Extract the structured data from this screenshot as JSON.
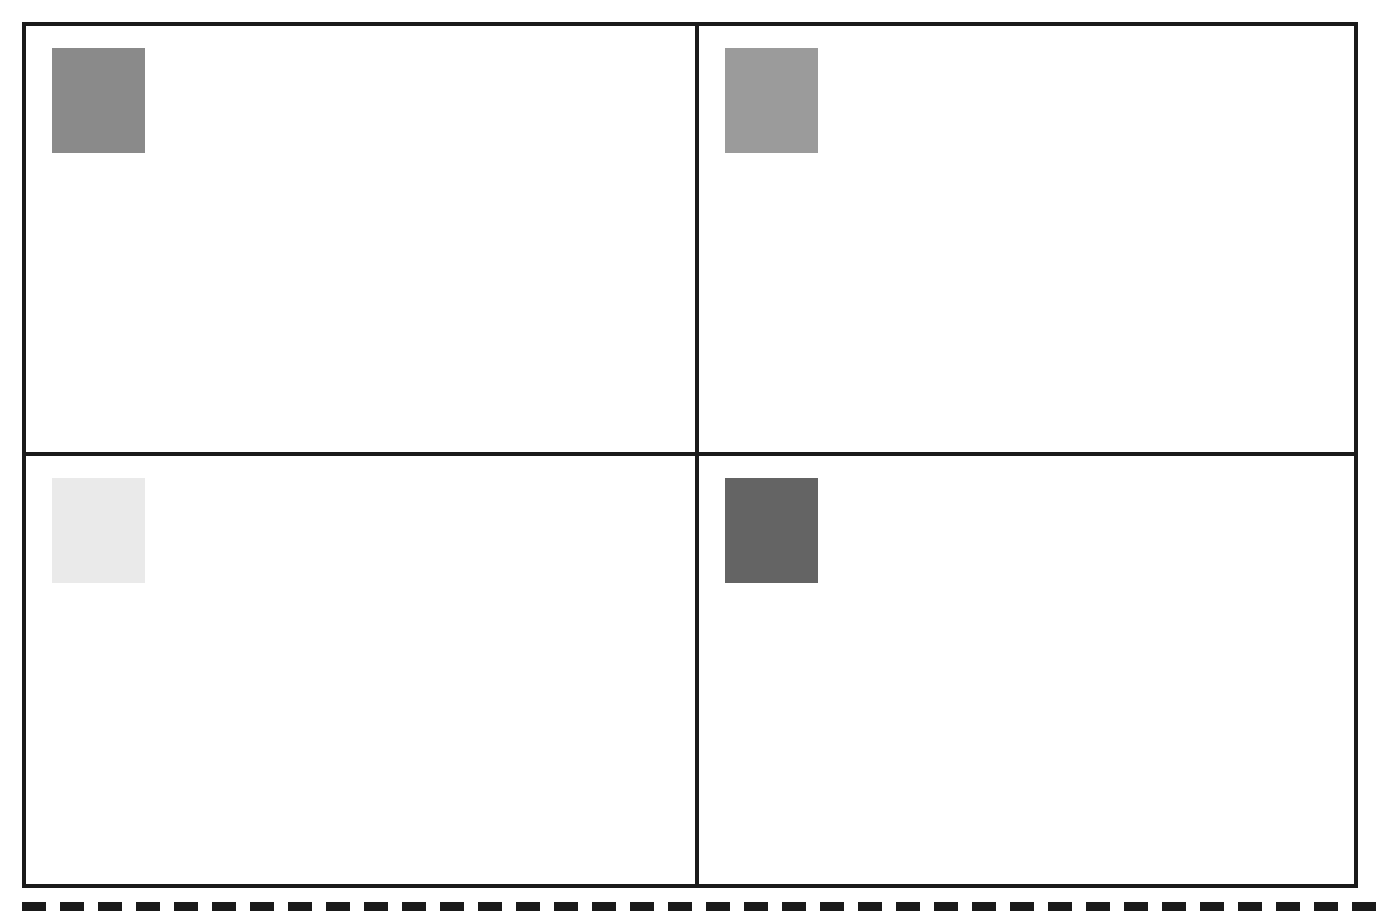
{
  "figure": {
    "background_color": "#ffffff",
    "width": 1378,
    "height": 921,
    "frame": {
      "border_color": "#1a1a1a",
      "border_width": 4,
      "x": 22,
      "y": 22,
      "width": 1336,
      "height": 866
    },
    "dividers": {
      "vertical_x": 695,
      "horizontal_y": 452,
      "color": "#1a1a1a",
      "thickness": 4
    },
    "dashed_rule": {
      "label": "dashed separator",
      "color": "#1a1a1a",
      "y": 902,
      "thickness": 9,
      "dash_length": 24,
      "gap_length": 14
    }
  },
  "panels": [
    {
      "id": "top-left",
      "position": "top-left",
      "label": "",
      "swatch": {
        "name": "gray-swatch-medium",
        "color": "#8a8a8a",
        "gray_value": 138,
        "x": 52,
        "y": 48,
        "width": 93,
        "height": 105
      }
    },
    {
      "id": "top-right",
      "position": "top-right",
      "label": "",
      "swatch": {
        "name": "gray-swatch-light-medium",
        "color": "#9b9b9b",
        "gray_value": 155,
        "x": 720,
        "y": 48,
        "width": 93,
        "height": 105
      }
    },
    {
      "id": "bottom-left",
      "position": "bottom-left",
      "label": "",
      "swatch": {
        "name": "gray-swatch-very-light",
        "color": "#eaeaea",
        "gray_value": 234,
        "x": 52,
        "y": 481,
        "width": 93,
        "height": 105
      }
    },
    {
      "id": "bottom-right",
      "position": "bottom-right",
      "label": "",
      "swatch": {
        "name": "gray-swatch-dark",
        "color": "#646464",
        "gray_value": 100,
        "x": 720,
        "y": 481,
        "width": 93,
        "height": 105
      }
    }
  ],
  "chart_data": {
    "type": "heatmap",
    "title": "",
    "xlabel": "",
    "ylabel": "",
    "categories": [
      "top-left",
      "top-right",
      "bottom-left",
      "bottom-right"
    ],
    "values": [
      138,
      155,
      234,
      100
    ],
    "colors": [
      "#8a8a8a",
      "#9b9b9b",
      "#eaeaea",
      "#646464"
    ],
    "grid": true,
    "legend": "none"
  }
}
